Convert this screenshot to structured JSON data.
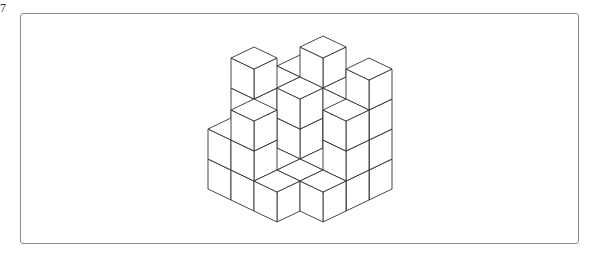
{
  "question": {
    "number": "7"
  },
  "figure": {
    "type": "isometric-cube-stack",
    "grid_size": [
      4,
      4
    ],
    "heights": [
      [
        3,
        3,
        4,
        2
      ],
      [
        4,
        3,
        1,
        3
      ],
      [
        3,
        1,
        1,
        1
      ],
      [
        4,
        3,
        1,
        0
      ]
    ],
    "projection": {
      "origin_x": 300,
      "origin_y": 145,
      "half_width": 23,
      "half_height": 11,
      "cube_height": 30
    },
    "line_color": "#333333",
    "face_color": "#ffffff"
  },
  "frame": {
    "border_color": "#8a8a8a"
  }
}
